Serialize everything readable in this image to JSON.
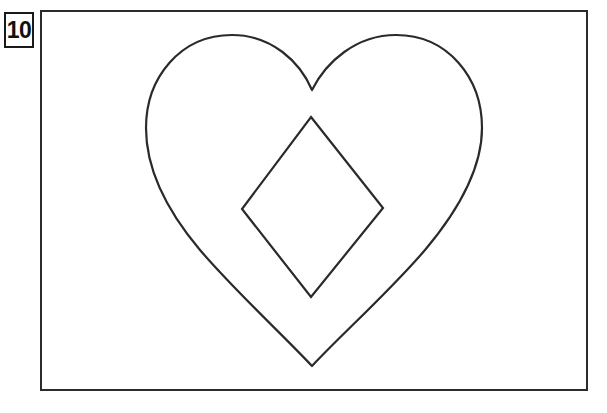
{
  "page": {
    "background_color": "#ffffff",
    "width": 607,
    "height": 413
  },
  "label": {
    "name": "figure-number-badge",
    "text": "10",
    "border_color": "#1a1a1a",
    "text_color": "#111111",
    "box": {
      "x": 4,
      "y": 12,
      "width": 30,
      "height": 36
    }
  },
  "frame": {
    "name": "drawing-frame",
    "border_color": "#2b2b2b",
    "fill_color": "#ffffff",
    "stroke_width": 2,
    "box": {
      "x": 40,
      "y": 10,
      "width": 548,
      "height": 381
    }
  },
  "figure": {
    "stroke_color": "#2a2a2a",
    "fill_color": "none",
    "stroke_width": 2.2,
    "shapes": [
      {
        "name": "heart-outline",
        "type": "heart",
        "bottom_tip": {
          "x": 312,
          "y": 366
        },
        "cleft": {
          "x": 312,
          "y": 90
        },
        "left_lobe_peak": {
          "x": 230,
          "y": 39
        },
        "right_lobe_peak": {
          "x": 399,
          "y": 38
        },
        "leftmost": {
          "x": 146,
          "y": 142
        },
        "rightmost": {
          "x": 482,
          "y": 147
        },
        "path": "M 312 90 C 300 62 272 35 232 35 C 180 35 146 78 146 128 C 146 170 168 212 200 250 C 235 291 280 332 312 366 C 344 332 390 291 425 250 C 457 212 482 170 482 128 C 482 78 448 35 396 35 C 356 35 326 62 312 90 Z"
      },
      {
        "name": "diamond-outline",
        "type": "polygon",
        "vertices": [
          {
            "label": "top",
            "x": 311,
            "y": 117
          },
          {
            "label": "right",
            "x": 383,
            "y": 208
          },
          {
            "label": "bottom",
            "x": 311,
            "y": 297
          },
          {
            "label": "left",
            "x": 242,
            "y": 209
          }
        ],
        "points": "311,117 383,208 311,297 242,209"
      }
    ]
  }
}
